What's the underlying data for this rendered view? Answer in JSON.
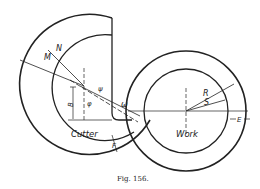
{
  "figure": {
    "caption": "Fig. 156.",
    "colors": {
      "line": "#222222",
      "background": "#ffffff"
    }
  },
  "cutter": {
    "label": "Cutter",
    "dimension_labels": {
      "M": "M",
      "N": "N",
      "B": "B",
      "F": "F",
      "phi": "φ",
      "psi": "ψ",
      "omega": "ω"
    }
  },
  "work": {
    "label": "Work",
    "dimension_labels": {
      "R": "R",
      "S": "S",
      "E": "E"
    }
  }
}
